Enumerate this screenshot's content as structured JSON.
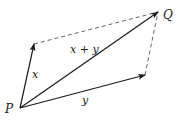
{
  "diagram": {
    "type": "vector-parallelogram",
    "colors": {
      "vector": "#1a1a1a",
      "dashed": "#555555",
      "label": "#222222",
      "background": "#ffffff"
    },
    "points": {
      "P": {
        "label": "P",
        "x": 20,
        "y": 108
      },
      "X_tip": {
        "x": 34,
        "y": 44
      },
      "Q": {
        "label": "Q",
        "x": 158,
        "y": 12
      },
      "Y_tip": {
        "x": 145,
        "y": 75
      }
    },
    "vectors": [
      {
        "name": "x",
        "label": "x",
        "from": "P",
        "to": "X_tip"
      },
      {
        "name": "y",
        "label": "y",
        "from": "P",
        "to": "Y_tip"
      },
      {
        "name": "sum",
        "label": "x + y",
        "from": "P",
        "to": "Q"
      }
    ],
    "dashed_edges": [
      {
        "from": "X_tip",
        "to": "Q"
      },
      {
        "from": "Y_tip",
        "to": "Q"
      }
    ],
    "labels": {
      "P": "P",
      "Q": "Q",
      "x": "x",
      "y": "y",
      "sum": "x + y"
    }
  }
}
